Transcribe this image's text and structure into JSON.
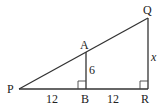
{
  "diagram": {
    "type": "geometry-similar-triangles",
    "points": {
      "P": {
        "label": "P",
        "x": 19,
        "y": 89
      },
      "B": {
        "label": "B",
        "x": 86,
        "y": 89
      },
      "R": {
        "label": "R",
        "x": 148,
        "y": 89
      },
      "A": {
        "label": "A",
        "x": 86,
        "y": 52
      },
      "Q": {
        "label": "Q",
        "x": 148,
        "y": 18
      }
    },
    "segments": [
      "PR",
      "PQ",
      "QR",
      "AB"
    ],
    "right_angles": [
      "B",
      "R"
    ],
    "measurements": {
      "PB": "12",
      "BR": "12",
      "AB": "6",
      "QR": "x"
    }
  }
}
